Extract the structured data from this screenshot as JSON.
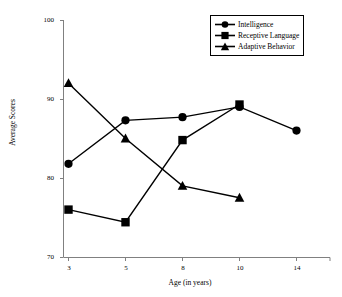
{
  "chart_data": {
    "type": "line",
    "title": "",
    "xlabel": "Age (in years)",
    "ylabel": "Average Scores",
    "categories": [
      "3",
      "5",
      "8",
      "10",
      "14"
    ],
    "ylim": [
      70,
      100
    ],
    "yticks": [
      "70",
      "80",
      "90",
      "100"
    ],
    "grid": false,
    "legend_position": "top-right",
    "series": [
      {
        "name": "Intelligence",
        "marker": "circle",
        "values": [
          81.8,
          87.3,
          87.7,
          89.0,
          86.0
        ]
      },
      {
        "name": "Receptive Language",
        "marker": "square",
        "values": [
          76.0,
          74.4,
          84.8,
          89.3,
          null
        ]
      },
      {
        "name": "Adaptive Behavior",
        "marker": "triangle",
        "values": [
          92.0,
          85.0,
          79.0,
          77.5,
          null
        ]
      }
    ]
  },
  "axes": {
    "y_title": "Average Scores",
    "x_title": "Age (in years)",
    "y_ticks": [
      "100",
      "90",
      "80",
      "70"
    ],
    "x_ticks": [
      "3",
      "5",
      "8",
      "10",
      "14"
    ]
  },
  "legend": {
    "items": [
      {
        "label": "Intelligence",
        "marker": "circle"
      },
      {
        "label": "Receptive Language",
        "marker": "square"
      },
      {
        "label": "Adaptive Behavior",
        "marker": "triangle"
      }
    ]
  },
  "colors": {
    "series": "#000000",
    "axis": "#808080",
    "background": "#ffffff"
  }
}
